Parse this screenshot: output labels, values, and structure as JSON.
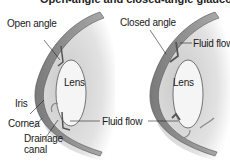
{
  "title": "Open-angle and closed-angle glaucoma",
  "colors": {
    "cornea": "#8f8f8f",
    "cornea_edge": "#5a5a5a",
    "eye_body": "#d8d8d8",
    "lens": "#f4f4f4",
    "line": "#222222"
  },
  "left_diagram": {
    "heading": "Open angle",
    "labels": {
      "lens": "Lens",
      "iris": "Iris",
      "cornea": "Cornea",
      "drainage_line1": "Drainage",
      "drainage_line2": "canal"
    }
  },
  "right_diagram": {
    "heading": "Closed angle",
    "labels": {
      "lens": "Lens",
      "fluid_flow": "Fluid flow"
    }
  },
  "shared": {
    "fluid_flow": "Fluid flow"
  }
}
